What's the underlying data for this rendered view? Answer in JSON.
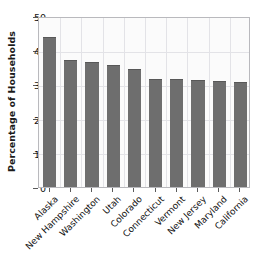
{
  "chart_data": {
    "type": "bar",
    "title": "",
    "xlabel": "",
    "ylabel": "Percentage of Households",
    "ylim": [
      0,
      50
    ],
    "yticks": [
      0,
      10,
      20,
      30,
      40,
      50
    ],
    "grid": true,
    "legend": "none",
    "bar_color": "#6e6e6e",
    "plot_background": "#fbfbfb",
    "grid_color": "#e3e3e7",
    "categories": [
      "Alaska",
      "New Hampshire",
      "Washington",
      "Utah",
      "Colorado",
      "Connecticut",
      "Vermont",
      "New Jersey",
      "Maryland",
      "California"
    ],
    "values": [
      44.0,
      37.0,
      36.5,
      35.7,
      34.5,
      31.7,
      31.7,
      31.2,
      30.9,
      30.6
    ]
  }
}
